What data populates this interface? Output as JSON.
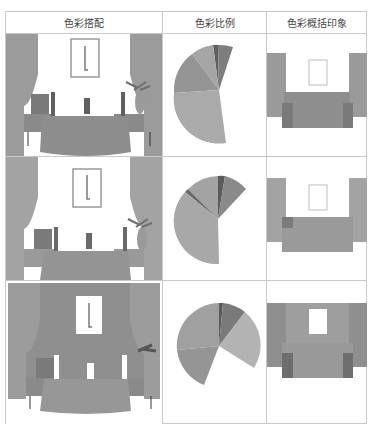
{
  "header": {
    "col1": "色彩搭配",
    "col2": "色彩比例",
    "col3": "色彩概括印象"
  },
  "colors": {
    "border": "#c9c9c9",
    "wall_light": "#ffffff",
    "wall_dark": "#8f8f8f",
    "curtain": "#9a9a9a",
    "bed": "#8c8c8c",
    "furniture": "#6e6e6e"
  },
  "rows": [
    {
      "name": "scheme-1",
      "wall": "light",
      "pie": [
        {
          "label": "dark",
          "value": 4,
          "color": "#5f5f5f"
        },
        {
          "label": "mid-dark",
          "value": 7,
          "color": "#7d7d7d"
        },
        {
          "label": "mid",
          "value": 10,
          "color": "#a5a5a5"
        },
        {
          "label": "mid-2",
          "value": 16,
          "color": "#959595"
        },
        {
          "label": "light-large",
          "value": 28,
          "color": "#aaaaaa"
        }
      ]
    },
    {
      "name": "scheme-2",
      "wall": "light",
      "pie": [
        {
          "label": "dark",
          "value": 3,
          "color": "#5a5a5a"
        },
        {
          "label": "mid-dark",
          "value": 9,
          "color": "#8a8a8a"
        },
        {
          "label": "mid",
          "value": 11,
          "color": "#a3a3a3"
        },
        {
          "label": "thin",
          "value": 2,
          "color": "#6a6a6a"
        },
        {
          "label": "light-large",
          "value": 36,
          "color": "#a8a8a8"
        }
      ]
    },
    {
      "name": "scheme-3",
      "wall": "dark",
      "pie": [
        {
          "label": "dark",
          "value": 2,
          "color": "#5a5a5a"
        },
        {
          "label": "mid-dark",
          "value": 8,
          "color": "#7a7a7a"
        },
        {
          "label": "light",
          "value": 20,
          "color": "#b3b3b3"
        },
        {
          "label": "mid",
          "value": 14,
          "color": "#959595"
        },
        {
          "label": "large",
          "value": 30,
          "color": "#a0a0a0"
        }
      ]
    }
  ]
}
